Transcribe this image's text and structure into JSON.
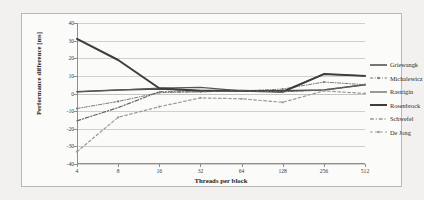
{
  "chart_data": {
    "type": "line",
    "title": "",
    "xlabel": "Threads per block",
    "ylabel": "Performance difference [ms]",
    "categories": [
      "4",
      "8",
      "16",
      "32",
      "64",
      "128",
      "256",
      "512"
    ],
    "x_tick_labels": [
      "4",
      "8",
      "16",
      "32",
      "64",
      "128",
      "256",
      "512"
    ],
    "y_tick_labels": [
      "40",
      "30",
      "20",
      "10",
      "0",
      "-10",
      "-20",
      "-30",
      "-40"
    ],
    "y_tick_values": [
      40,
      30,
      20,
      10,
      0,
      -10,
      -20,
      -30,
      -40
    ],
    "ylim": [
      -40,
      40
    ],
    "grid": "horizontal",
    "legend_position": "right",
    "series": [
      {
        "name": "Griewangk",
        "values": [
          1,
          2,
          2.5,
          1.5,
          1.5,
          1.5,
          2,
          5
        ],
        "style": "solid",
        "color": "#4a4a4a",
        "width": 1.5,
        "marker": "none"
      },
      {
        "name": "Michalewicz",
        "values": [
          -8.5,
          -4.5,
          0.5,
          1,
          1.5,
          2.5,
          6.5,
          5
        ],
        "style": "dashdot",
        "color": "#7b7b7b",
        "width": 1.0,
        "marker": "dot"
      },
      {
        "name": "Rastrigin",
        "values": [
          1,
          2,
          3,
          3.5,
          1.5,
          1,
          11,
          10
        ],
        "style": "solid",
        "color": "#585858",
        "width": 1.2,
        "marker": "none"
      },
      {
        "name": "Rosenbrock",
        "values": [
          31,
          19,
          3,
          1.5,
          1.5,
          1,
          11,
          10
        ],
        "style": "solid",
        "color": "#3d3d3d",
        "width": 2.0,
        "marker": "none"
      },
      {
        "name": "Schwefel",
        "values": [
          -15.5,
          -8,
          1,
          1,
          1.5,
          1,
          2,
          5
        ],
        "style": "dashdot",
        "color": "#636363",
        "width": 1.2,
        "marker": "none"
      },
      {
        "name": "De Jong",
        "values": [
          -33,
          -13.5,
          -7.5,
          -2.5,
          -3,
          -5,
          1.5,
          0
        ],
        "style": "dashed",
        "color": "#9a9a9a",
        "width": 1.2,
        "marker": "dot"
      }
    ]
  },
  "legend": {
    "items": [
      {
        "label": "Griewangk"
      },
      {
        "label": "Michalewicz"
      },
      {
        "label": "Rastrigin"
      },
      {
        "label": "Rosenbrock"
      },
      {
        "label": "Schwefel"
      },
      {
        "label": "De Jong"
      }
    ]
  }
}
